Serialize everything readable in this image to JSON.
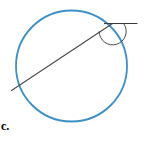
{
  "figure": {
    "part_label": "c.",
    "caption": "",
    "background_color": "#ffffff",
    "circle": {
      "name": "circle",
      "stroke_color": "#3d90c4",
      "stroke_width": 1.8,
      "center_x": 71.5,
      "center_y": 66,
      "radius": 55.5
    },
    "secant_line": {
      "name": "secant-line",
      "stroke_color": "#4a4a4a",
      "stroke_width": 1.1,
      "x1": 11.5,
      "y1": 90.5,
      "x2": 112.5,
      "y2": 23.5
    },
    "tangent_line": {
      "name": "tangent-line",
      "stroke_color": "#3a3a3a",
      "stroke_width": 1.1,
      "x1": 104.5,
      "y1": 23.5,
      "x2": 137.0,
      "y2": 23.5
    },
    "angle_arc": {
      "name": "angle-arc",
      "stroke_color": "#4a4a4a",
      "stroke_width": 1.0,
      "vertex_x": 110.5,
      "vertex_y": 24.0,
      "radius": 13.5,
      "start_angle_deg": 0,
      "end_angle_deg": 213
    }
  }
}
